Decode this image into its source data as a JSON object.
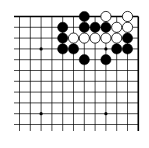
{
  "board": {
    "view": "top-right corner of 19x19 Go board",
    "visible_columns": 12,
    "visible_rows": 11,
    "colors": {
      "background": "#ffffff",
      "line": "#000000",
      "black_stone": "#000000",
      "white_stone": "#ffffff"
    },
    "star_points": [
      [
        2,
        3
      ],
      [
        8,
        3
      ],
      [
        2,
        9
      ],
      [
        8,
        9
      ]
    ],
    "stones": [
      {
        "color": "black",
        "col": 6,
        "row": 0
      },
      {
        "color": "white",
        "col": 8,
        "row": 0
      },
      {
        "color": "white",
        "col": 10,
        "row": 0
      },
      {
        "color": "black",
        "col": 4,
        "row": 1
      },
      {
        "color": "black",
        "col": 6,
        "row": 1
      },
      {
        "color": "black",
        "col": 7,
        "row": 1
      },
      {
        "color": "black",
        "col": 8,
        "row": 1
      },
      {
        "color": "white",
        "col": 9,
        "row": 1
      },
      {
        "color": "white",
        "col": 10,
        "row": 1
      },
      {
        "color": "black",
        "col": 4,
        "row": 2
      },
      {
        "color": "white",
        "col": 5,
        "row": 2
      },
      {
        "color": "white",
        "col": 6,
        "row": 2
      },
      {
        "color": "white",
        "col": 7,
        "row": 2
      },
      {
        "color": "white",
        "col": 8,
        "row": 2
      },
      {
        "color": "white",
        "col": 9,
        "row": 2
      },
      {
        "color": "black",
        "col": 10,
        "row": 2
      },
      {
        "color": "black",
        "col": 4,
        "row": 3
      },
      {
        "color": "black",
        "col": 5,
        "row": 3
      },
      {
        "color": "black",
        "col": 9,
        "row": 3
      },
      {
        "color": "black",
        "col": 10,
        "row": 3
      },
      {
        "color": "black",
        "col": 6,
        "row": 4
      },
      {
        "color": "black",
        "col": 8,
        "row": 4
      }
    ]
  }
}
